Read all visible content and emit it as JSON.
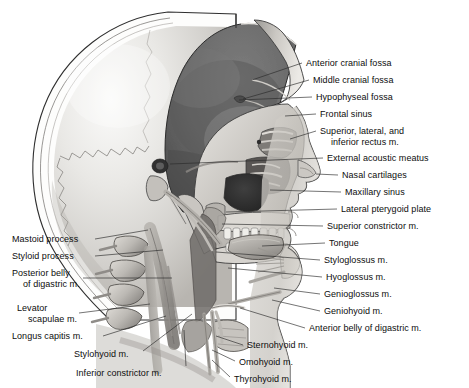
{
  "plate": {
    "title": "Sagittal Section of the Head and Neck",
    "view": "Median sagittal section, left lateral view",
    "medium": "Grayscale anatomical illustration",
    "width": 469,
    "height": 388,
    "background_color": "#ffffff",
    "text_color": "#0d0d0d",
    "leader_color": "#2a2a2a"
  },
  "palette": {
    "background": "#ffffff",
    "calvaria_outer": "#d8d8d6",
    "calvaria_highlight": "#f2f2f0",
    "cranial_cavity": "#6d6d6d",
    "cranial_cavity_dark": "#565656",
    "bone_light": "#e6e4e0",
    "bone_mid": "#c3c0bb",
    "bone_shadow": "#8e8b86",
    "muscle_mid": "#a9a6a1",
    "muscle_dark": "#7b7874",
    "soft_tissue": "#cfccc7",
    "outline": "#3a3a3a",
    "tooth": "#efeeea"
  },
  "labels_right": [
    {
      "id": "anterior-cranial-fossa",
      "text": "Anterior cranial fossa",
      "x": 306,
      "y": 58,
      "leader": [
        [
          302,
          63
        ],
        [
          252,
          80
        ]
      ]
    },
    {
      "id": "middle-cranial-fossa",
      "text": "Middle cranial fossa",
      "x": 313,
      "y": 75,
      "leader": [
        [
          309,
          80
        ],
        [
          243,
          99
        ]
      ]
    },
    {
      "id": "hypophyseal-fossa",
      "text": "Hypophyseal fossa",
      "x": 316,
      "y": 92,
      "leader": [
        [
          312,
          97
        ],
        [
          239,
          100
        ]
      ]
    },
    {
      "id": "frontal-sinus",
      "text": "Frontal sinus",
      "x": 320,
      "y": 109,
      "leader": [
        [
          316,
          114
        ],
        [
          281,
          116
        ]
      ]
    },
    {
      "id": "superior-lateral-inferior-rectus",
      "text": "Superior, lateral, and",
      "text2": "inferior rectus m.",
      "x": 320,
      "y": 126,
      "leader": [
        [
          316,
          131
        ],
        [
          286,
          139
        ]
      ]
    },
    {
      "id": "external-acoustic-meatus",
      "text": "External acoustic meatus",
      "x": 327,
      "y": 153,
      "leader": [
        [
          323,
          158
        ],
        [
          212,
          163
        ]
      ]
    },
    {
      "id": "nasal-cartilages",
      "text": "Nasal cartilages",
      "x": 342,
      "y": 170,
      "leader": [
        [
          338,
          175
        ],
        [
          310,
          177
        ]
      ]
    },
    {
      "id": "maxillary-sinus",
      "text": "Maxillary sinus",
      "x": 345,
      "y": 187,
      "leader": [
        [
          341,
          192
        ],
        [
          268,
          190
        ]
      ]
    },
    {
      "id": "lateral-pterygoid-plate",
      "text": "Lateral pterygoid plate",
      "x": 341,
      "y": 204,
      "leader": [
        [
          337,
          209
        ],
        [
          222,
          213
        ]
      ]
    },
    {
      "id": "superior-constrictor",
      "text": "Superior constrictor m.",
      "x": 327,
      "y": 221,
      "leader": [
        [
          323,
          226
        ],
        [
          218,
          228
        ]
      ]
    },
    {
      "id": "tongue",
      "text": "Tongue",
      "x": 329,
      "y": 238,
      "leader": [
        [
          325,
          243
        ],
        [
          235,
          247
        ]
      ]
    },
    {
      "id": "styloglossus",
      "text": "Styloglossus m.",
      "x": 324,
      "y": 255,
      "leader": [
        [
          320,
          260
        ],
        [
          209,
          259
        ]
      ]
    },
    {
      "id": "hyoglossus",
      "text": "Hyoglossus m.",
      "x": 326,
      "y": 272,
      "leader": [
        [
          322,
          277
        ],
        [
          221,
          274
        ]
      ]
    },
    {
      "id": "genioglossus",
      "text": "Genioglossus m.",
      "x": 324,
      "y": 289,
      "leader": [
        [
          320,
          294
        ],
        [
          271,
          290
        ]
      ]
    },
    {
      "id": "geniohyoid",
      "text": "Geniohyoid m.",
      "x": 324,
      "y": 306,
      "leader": [
        [
          320,
          311
        ],
        [
          268,
          304
        ]
      ]
    },
    {
      "id": "anterior-belly-digastric",
      "text": "Anterior belly of digastric m.",
      "x": 309,
      "y": 323,
      "leader": [
        [
          305,
          328
        ],
        [
          232,
          324
        ]
      ]
    },
    {
      "id": "sternohyoid",
      "text": "Sternohyoid m.",
      "x": 247,
      "y": 340,
      "leader": [
        [
          243,
          345
        ],
        [
          214,
          337
        ]
      ]
    },
    {
      "id": "omohyoid",
      "text": "Omohyoid m.",
      "x": 239,
      "y": 357,
      "leader": [
        [
          235,
          361
        ],
        [
          212,
          350
        ]
      ]
    },
    {
      "id": "thyrohyoid",
      "text": "Thyrohyoid m.",
      "x": 234,
      "y": 374,
      "leader": [
        [
          230,
          377
        ],
        [
          210,
          360
        ]
      ]
    }
  ],
  "labels_left": [
    {
      "id": "mastoid-process",
      "text": "Mastoid process",
      "x": 12,
      "y": 234,
      "anchor": "right",
      "leader": [
        [
          95,
          239
        ],
        [
          150,
          232
        ]
      ]
    },
    {
      "id": "styloid-process",
      "text": "Styloid process",
      "x": 12,
      "y": 251,
      "anchor": "right",
      "leader": [
        [
          95,
          256
        ],
        [
          160,
          251
        ]
      ]
    },
    {
      "id": "posterior-belly-digastric",
      "text": "Posterior belly",
      "text2": "of digastric m.",
      "x": 12,
      "y": 268,
      "anchor": "right",
      "leader": [
        [
          83,
          278
        ],
        [
          168,
          281
        ]
      ]
    },
    {
      "id": "levator-scapulae",
      "text": "Levator",
      "text2": "scapulae m.",
      "x": 17,
      "y": 303,
      "anchor": "right",
      "leader": [
        [
          79,
          313
        ],
        [
          160,
          305
        ]
      ]
    },
    {
      "id": "longus-capitis",
      "text": "Longus capitis m.",
      "x": 12,
      "y": 331,
      "anchor": "right",
      "leader": [
        [
          103,
          336
        ],
        [
          172,
          318
        ]
      ]
    },
    {
      "id": "stylohyoid",
      "text": "Stylohyoid m.",
      "x": 74,
      "y": 349,
      "anchor": "right",
      "leader": [
        [
          143,
          351
        ],
        [
          190,
          316
        ]
      ]
    },
    {
      "id": "inferior-constrictor",
      "text": "Inferior constrictor m.",
      "x": 76,
      "y": 368,
      "anchor": "right",
      "leader": [
        [
          185,
          367
        ],
        [
          184,
          330
        ]
      ]
    }
  ]
}
